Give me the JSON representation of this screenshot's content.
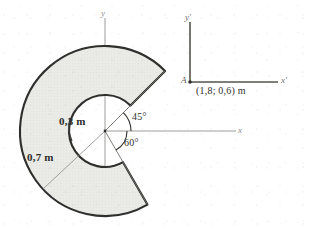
{
  "figure": {
    "type": "engineering-diagram",
    "colors": {
      "shape_fill": "#e9e9e6",
      "shape_stroke": "#2e2e2c",
      "axis_stroke": "#9a9a96",
      "inset_stroke": "#55554f",
      "text": "#2e2e2c",
      "background": "#ffffff"
    },
    "main_shape": {
      "name": "annular-sector",
      "center_px": [
        105,
        131
      ],
      "inner_radius_px": 36,
      "outer_radius_px": 85,
      "start_angle_deg": 45,
      "end_angle_deg": -60,
      "sweep": "counterclockwise",
      "inner_radius_label": "0,3 m",
      "outer_radius_label": "0,7 m"
    },
    "main_axes": {
      "x_label": "x",
      "y_label": "y",
      "origin_px": [
        105,
        131
      ]
    },
    "angles": [
      {
        "id": "upper",
        "label": "45°",
        "value_deg": 45
      },
      {
        "id": "lower",
        "label": "60°",
        "value_deg": 60
      }
    ],
    "inset_frame": {
      "name": "reference-frame",
      "origin_px": [
        190,
        82
      ],
      "point_label": "A",
      "x_label": "x'",
      "y_label": "y'",
      "coordinate_label": "(1,8; 0,6) m"
    }
  }
}
